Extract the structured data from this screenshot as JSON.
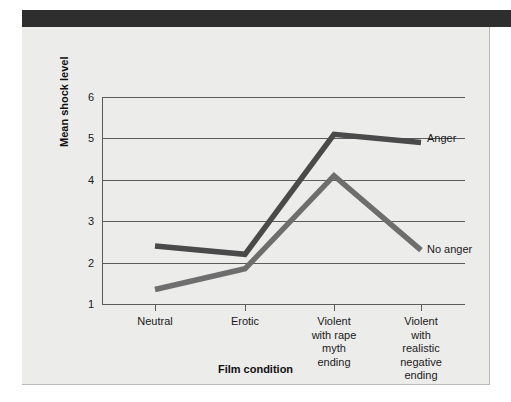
{
  "figure": {
    "background_color": "#ececeb",
    "header_band_color": "#2e2e2e"
  },
  "chart_data": {
    "type": "line",
    "title": "",
    "xlabel": "Film condition",
    "ylabel": "Mean shock level",
    "categories": [
      "Neutral",
      "Erotic",
      "Violent\nwith rape\nmyth\nending",
      "Violent\nwith\nrealistic\nnegative\nending"
    ],
    "ylim": [
      1,
      6
    ],
    "yticks": [
      1,
      2,
      3,
      4,
      5,
      6
    ],
    "ytick_labels": [
      "1",
      "2",
      "3",
      "4",
      "5",
      "6"
    ],
    "grid": true,
    "legend_position": "inline-right",
    "series": [
      {
        "name": "Anger",
        "color": "#4a4a4a",
        "values": [
          2.4,
          2.2,
          5.1,
          4.9
        ]
      },
      {
        "name": "No anger",
        "color": "#6e6e6e",
        "values": [
          1.35,
          1.85,
          4.1,
          2.3
        ]
      }
    ]
  }
}
